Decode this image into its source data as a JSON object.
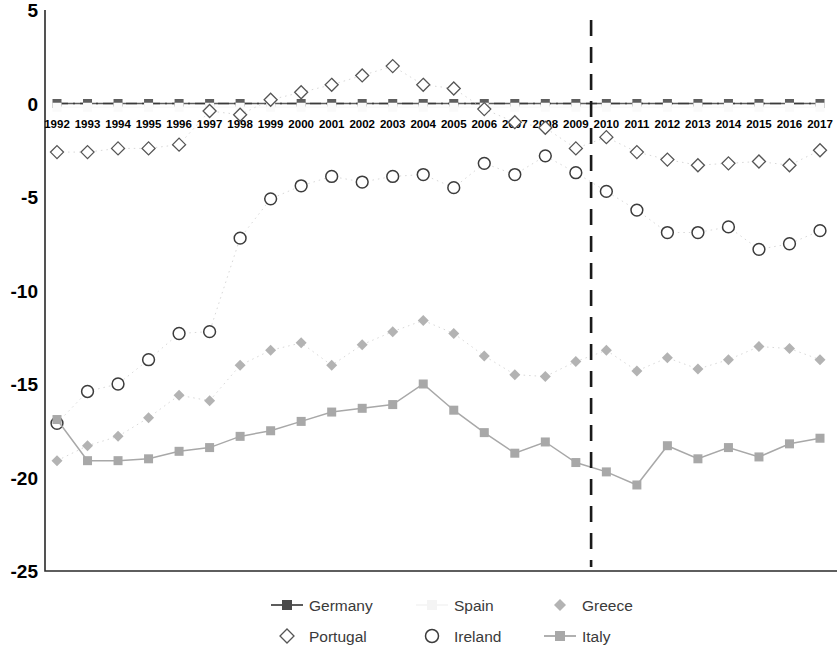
{
  "chart_data": {
    "type": "line",
    "title": "",
    "subtitle": "",
    "xlabel": "",
    "ylabel": "",
    "categories": [
      "1992",
      "1993",
      "1994",
      "1995",
      "1996",
      "1997",
      "1998",
      "1999",
      "2000",
      "2001",
      "2002",
      "2003",
      "2004",
      "2005",
      "2006",
      "2007",
      "2008",
      "2009",
      "2010",
      "2011",
      "2012",
      "2013",
      "2014",
      "2015",
      "2016",
      "2017"
    ],
    "ylim": [
      -25,
      5
    ],
    "yticks": [
      5,
      0,
      -5,
      -10,
      -15,
      -20,
      -25
    ],
    "ytick_labels": [
      "5",
      "0",
      "-5",
      "-10",
      "-15",
      "-20",
      "-25"
    ],
    "grid": false,
    "legend_position": "bottom",
    "annotations": [
      {
        "name": "vertical-divider",
        "type": "vline",
        "x_between": [
          "2009",
          "2010"
        ],
        "style": "dashed"
      }
    ],
    "series": [
      {
        "name": "Germany",
        "color": "#5e5e5e",
        "marker": "square",
        "line": "solid",
        "values": [
          0,
          0,
          0,
          0,
          0,
          0,
          0,
          0,
          0,
          0,
          0,
          0,
          0,
          0,
          0,
          0,
          0,
          0,
          0,
          0,
          0,
          0,
          0,
          0,
          0,
          0
        ]
      },
      {
        "name": "Spain",
        "color": "#fafafa",
        "marker": "square",
        "line": "solid",
        "values": [
          -0.2,
          -0.2,
          -0.2,
          -0.2,
          -0.2,
          -0.2,
          -0.2,
          -0.2,
          -0.2,
          -0.2,
          -0.2,
          -0.2,
          -0.2,
          -0.2,
          -0.2,
          -0.2,
          -0.2,
          -0.2,
          -0.2,
          -0.2,
          -0.2,
          -0.2,
          -0.2,
          -0.2,
          -0.2,
          -0.2
        ]
      },
      {
        "name": "Greece",
        "color": "#b3b3b3",
        "marker": "diamond-filled",
        "line": "dotted",
        "values": [
          -19.1,
          -18.3,
          -17.8,
          -16.8,
          -15.6,
          -15.9,
          -14.0,
          -13.2,
          -12.8,
          -14.0,
          -12.9,
          -12.2,
          -11.6,
          -12.3,
          -13.5,
          -14.5,
          -14.6,
          -13.8,
          -13.2,
          -14.3,
          -13.6,
          -14.2,
          -13.7,
          -13.0,
          -13.1,
          -13.7
        ]
      },
      {
        "name": "Portugal",
        "color": "#555555",
        "marker": "diamond-open",
        "line": "dotted",
        "values": [
          -2.6,
          -2.6,
          -2.4,
          -2.4,
          -2.2,
          -0.4,
          -0.6,
          0.2,
          0.6,
          1.0,
          1.5,
          2.0,
          1.0,
          0.8,
          -0.3,
          -1.0,
          -1.3,
          -2.4,
          -1.8,
          -2.6,
          -3.0,
          -3.3,
          -3.2,
          -3.1,
          -3.3,
          -2.5
        ]
      },
      {
        "name": "Ireland",
        "color": "#3c3c3c",
        "marker": "circle-open",
        "line": "dotted",
        "values": [
          -17.1,
          -15.4,
          -15.0,
          -13.7,
          -12.3,
          -12.2,
          -7.2,
          -5.1,
          -4.4,
          -3.9,
          -4.2,
          -3.9,
          -3.8,
          -4.5,
          -3.2,
          -3.8,
          -2.8,
          -3.7,
          -4.7,
          -5.7,
          -6.9,
          -6.9,
          -6.6,
          -7.8,
          -7.5,
          -6.8
        ]
      },
      {
        "name": "Italy",
        "color": "#a8a8a8",
        "marker": "square",
        "line": "solid",
        "values": [
          -16.9,
          -19.1,
          -19.1,
          -19.0,
          -18.6,
          -18.4,
          -17.8,
          -17.5,
          -17.0,
          -16.5,
          -16.3,
          -16.1,
          -15.0,
          -16.4,
          -17.6,
          -18.7,
          -18.1,
          -19.2,
          -19.7,
          -20.4,
          -18.3,
          -19.0,
          -18.4,
          -18.9,
          -18.2,
          -17.9
        ]
      }
    ]
  },
  "legend": {
    "row1": [
      {
        "label": "Germany",
        "marker": "line-square",
        "color": "#4a4a4a"
      },
      {
        "label": "Spain",
        "marker": "line-square-faint",
        "color": "#f4f4f4"
      },
      {
        "label": "Greece",
        "marker": "diamond-filled",
        "color": "#b3b3b3"
      }
    ],
    "row2": [
      {
        "label": "Portugal",
        "marker": "diamond-open",
        "color": "#555555"
      },
      {
        "label": "Ireland",
        "marker": "circle-open",
        "color": "#3c3c3c"
      },
      {
        "label": "Italy",
        "marker": "line-square",
        "color": "#a8a8a8"
      }
    ]
  }
}
